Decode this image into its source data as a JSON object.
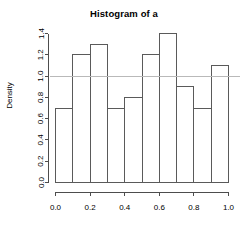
{
  "chart_data": {
    "type": "bar",
    "title": "Histogram of a",
    "xlabel": "",
    "ylabel": "Density",
    "categories": [
      "0.0-0.1",
      "0.1-0.2",
      "0.2-0.3",
      "0.3-0.4",
      "0.4-0.5",
      "0.5-0.6",
      "0.6-0.7",
      "0.7-0.8",
      "0.8-0.9",
      "0.9-1.0"
    ],
    "bin_edges": [
      0.0,
      0.1,
      0.2,
      0.3,
      0.4,
      0.5,
      0.6,
      0.7,
      0.8,
      0.9,
      1.0
    ],
    "values": [
      0.7,
      1.2,
      1.3,
      0.7,
      0.8,
      1.2,
      1.4,
      0.9,
      0.7,
      1.1
    ],
    "xlim": [
      0.0,
      1.0
    ],
    "ylim": [
      0.0,
      1.4
    ],
    "x_ticks": [
      0.0,
      0.2,
      0.4,
      0.6,
      0.8,
      1.0
    ],
    "x_tick_labels": [
      "0.0",
      "0.2",
      "0.4",
      "0.6",
      "0.8",
      "1.0"
    ],
    "y_ticks": [
      0.0,
      0.2,
      0.4,
      0.6,
      0.8,
      1.0,
      1.2,
      1.4
    ],
    "y_tick_labels": [
      "0.0",
      "0.2",
      "0.4",
      "0.6",
      "0.8",
      "1.0",
      "1.2",
      "1.4"
    ],
    "grid": false,
    "legend": null,
    "annotations": [
      {
        "kind": "horizontal-reference-line",
        "y": 1.0,
        "color": "#b9b9b9"
      }
    ],
    "bar_fill_color": "#ffffff",
    "bar_stroke_color": "#5a5a5a",
    "axis_color": "#4d4d4d"
  }
}
